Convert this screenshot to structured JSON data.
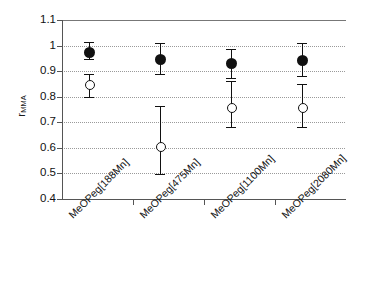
{
  "chart_data": {
    "type": "scatter",
    "title": "",
    "xlabel": "",
    "ylabel": "r",
    "ylabel_subscript": "MMA",
    "ylim": [
      0.4,
      1.1
    ],
    "ytick_labels": [
      "1.1",
      "1",
      "0.9",
      "0.8",
      "0.7",
      "0.6",
      "0.5",
      "0.4"
    ],
    "ytick_values": [
      1.1,
      1.0,
      0.9,
      0.8,
      0.7,
      0.6,
      0.5,
      0.4
    ],
    "grid": "horizontal-dotted",
    "legend": "none",
    "categories": [
      "MeOPeg[188Mn]",
      "MeOPeg[475Mn]",
      "MeOPeg[1100Mn]",
      "MeOPeg[2080Mn]"
    ],
    "series": [
      {
        "name": "filled-circles",
        "marker": "filled-circle",
        "values": [
          0.972,
          0.945,
          0.928,
          0.943
        ],
        "err_upper": [
          1.013,
          1.01,
          0.988,
          1.012
        ],
        "err_lower": [
          0.948,
          0.89,
          0.872,
          0.88
        ]
      },
      {
        "name": "open-circles",
        "marker": "open-circle",
        "values": [
          0.845,
          0.603,
          0.757,
          0.755
        ],
        "err_upper": [
          0.89,
          0.763,
          0.863,
          0.85
        ],
        "err_lower": [
          0.8,
          0.497,
          0.68,
          0.68
        ]
      }
    ]
  },
  "axis": {
    "y_axis_color": "#555555",
    "grid_color": "#9a9a9a",
    "marker_color": "#111111"
  }
}
